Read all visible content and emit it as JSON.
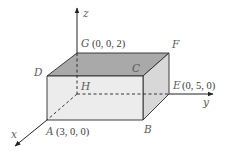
{
  "diagram": {
    "type": "3d-rectangular-box-in-coordinate-space",
    "axes": {
      "x": "x",
      "y": "y",
      "z": "z"
    },
    "vertices": {
      "A": {
        "label": "A",
        "coords": "(3, 0, 0)"
      },
      "B": {
        "label": "B"
      },
      "C": {
        "label": "C"
      },
      "D": {
        "label": "D"
      },
      "E": {
        "label": "E",
        "coords": "(0, 5, 0)"
      },
      "F": {
        "label": "F"
      },
      "G": {
        "label": "G",
        "coords": "(0, 0, 2)"
      },
      "H": {
        "label": "H"
      }
    },
    "colors": {
      "top_face": "#a9a9a9",
      "front_face": "#ececec",
      "side_face": "#d8d8d8",
      "edges": "#2a2a2a"
    }
  }
}
